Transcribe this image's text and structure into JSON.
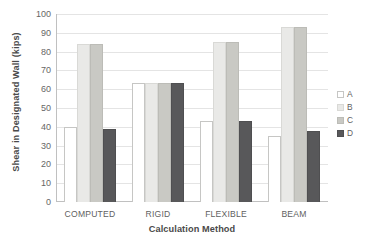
{
  "chart_data": {
    "type": "bar",
    "title": "",
    "xlabel": "Calculation Method",
    "ylabel": "Shear in Designated Wall (kips)",
    "categories": [
      "COMPUTED",
      "RIGID",
      "FLEXIBLE",
      "BEAM"
    ],
    "series": [
      {
        "name": "A",
        "color": "#ffffff",
        "values": [
          40,
          63.5,
          43,
          35
        ]
      },
      {
        "name": "B",
        "color": "#e9e9e7",
        "values": [
          84,
          63.5,
          85,
          93
        ]
      },
      {
        "name": "C",
        "color": "#c9c9c4",
        "values": [
          84,
          63.5,
          85,
          93
        ]
      },
      {
        "name": "D",
        "color": "#58585a",
        "values": [
          39,
          63.5,
          43,
          38
        ]
      }
    ],
    "ylim": [
      0,
      100
    ],
    "ytick_labels": [
      "100",
      "90",
      "80",
      "70",
      "60",
      "50",
      "40",
      "30",
      "20",
      "10",
      "0"
    ],
    "ytick_values": [
      100,
      90,
      80,
      70,
      60,
      50,
      40,
      30,
      20,
      10,
      0
    ],
    "grid": true,
    "legend_position": "right"
  },
  "legend": {
    "entries": [
      {
        "label": "A"
      },
      {
        "label": "B"
      },
      {
        "label": "C"
      },
      {
        "label": "D"
      }
    ]
  }
}
